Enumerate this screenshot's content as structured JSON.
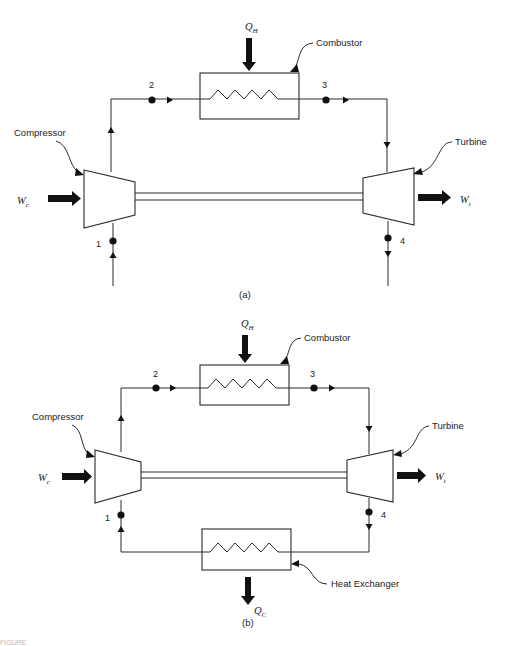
{
  "figure": {
    "title_fragment": "FIGURE",
    "panels": [
      {
        "id": "a",
        "caption": "(a)",
        "components": {
          "compressor": "Compressor",
          "combustor": "Combustor",
          "turbine": "Turbine"
        },
        "symbols": {
          "heat_in": {
            "main": "Q",
            "sub": "H"
          },
          "work_compressor": {
            "main": "W",
            "sub": "c"
          },
          "work_turbine": {
            "main": "W",
            "sub": "t"
          }
        },
        "state_points": [
          "1",
          "2",
          "3",
          "4"
        ],
        "cycle": "open"
      },
      {
        "id": "b",
        "caption": "(b)",
        "components": {
          "compressor": "Compressor",
          "combustor": "Combustor",
          "turbine": "Turbine",
          "heat_exchanger": "Heat Exchanger"
        },
        "symbols": {
          "heat_in": {
            "main": "Q",
            "sub": "H"
          },
          "heat_out": {
            "main": "Q",
            "sub": "C"
          },
          "work_compressor": {
            "main": "W",
            "sub": "c"
          },
          "work_turbine": {
            "main": "W",
            "sub": "t"
          }
        },
        "state_points": [
          "1",
          "2",
          "3",
          "4"
        ],
        "cycle": "closed"
      }
    ]
  }
}
